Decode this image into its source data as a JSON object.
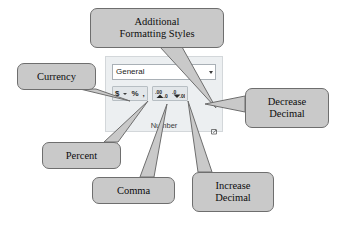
{
  "app": {
    "ribbon_group": {
      "name": "Number",
      "group_label": "Number",
      "dialog_launcher_icon": "dialog-box-launcher-icon",
      "number_format": {
        "value": "General",
        "placeholder": "General",
        "dropdown_icon": "chevron-down-icon"
      },
      "buttons": [
        {
          "name": "accounting-number-format",
          "glyph": "$",
          "icon": "dollar-icon"
        },
        {
          "name": "accounting-number-format-dropdown",
          "glyph": "",
          "icon": "chevron-down-icon"
        },
        {
          "name": "percent-style",
          "glyph": "%",
          "icon": "percent-icon"
        },
        {
          "name": "comma-style",
          "glyph": ",",
          "icon": "comma-icon"
        },
        {
          "name": "increase-decimal",
          "glyph": "",
          "icon": "increase-decimal-icon"
        },
        {
          "name": "decrease-decimal",
          "glyph": "",
          "icon": "decrease-decimal-icon"
        }
      ]
    }
  },
  "callouts": {
    "additional": {
      "line1": "Additional",
      "line2": "Formatting Styles"
    },
    "currency": {
      "line1": "Currency",
      "line2": ""
    },
    "percent": {
      "line1": "Percent",
      "line2": ""
    },
    "comma": {
      "line1": "Comma",
      "line2": ""
    },
    "increase": {
      "line1": "Increase",
      "line2": "Decimal"
    },
    "decrease": {
      "line1": "Decrease",
      "line2": "Decimal"
    }
  },
  "colors": {
    "callout_fill": "#c9c9c9",
    "callout_border": "#6e6e6e",
    "ribbon_fill": "#eceff1",
    "button_fill": "#e2e6e9",
    "page_background": "#ffffff"
  }
}
